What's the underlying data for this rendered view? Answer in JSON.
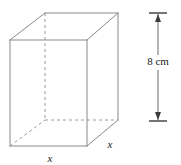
{
  "figure": {
    "type": "geometry-diagram",
    "shape_name": "rectangular-prism",
    "canvas": {
      "width": 181,
      "height": 165,
      "background": "#ffffff"
    },
    "styles": {
      "solid_edge_color": "#8a8a8a",
      "hidden_edge_color": "#9a9a9a",
      "dimension_line_color": "#3a3a3a",
      "label_color": "#1a1a1a",
      "solid_edge_width": 1,
      "hidden_edge_width": 1,
      "hidden_edge_dash": "3,3"
    },
    "vertices": {
      "front_top_left": {
        "x": 10,
        "y": 40
      },
      "front_top_right": {
        "x": 87,
        "y": 40
      },
      "front_bottom_right": {
        "x": 87,
        "y": 146
      },
      "front_bottom_left": {
        "x": 10,
        "y": 146
      },
      "back_top_left": {
        "x": 45,
        "y": 13
      },
      "back_top_right": {
        "x": 118,
        "y": 13
      },
      "back_bottom_right": {
        "x": 118,
        "y": 120
      },
      "back_bottom_left": {
        "x": 45,
        "y": 120
      }
    },
    "solid_edges": [
      {
        "name": "front-top-edge",
        "from": "front_top_left",
        "to": "front_top_right"
      },
      {
        "name": "front-right-edge",
        "from": "front_top_right",
        "to": "front_bottom_right"
      },
      {
        "name": "front-bottom-edge",
        "from": "front_bottom_right",
        "to": "front_bottom_left"
      },
      {
        "name": "front-left-edge",
        "from": "front_bottom_left",
        "to": "front_top_left"
      },
      {
        "name": "back-top-edge",
        "from": "back_top_left",
        "to": "back_top_right"
      },
      {
        "name": "back-right-edge",
        "from": "back_top_right",
        "to": "back_bottom_right"
      },
      {
        "name": "top-left-receding-edge",
        "from": "front_top_left",
        "to": "back_top_left"
      },
      {
        "name": "top-right-receding-edge",
        "from": "front_top_right",
        "to": "back_top_right"
      },
      {
        "name": "bottom-right-receding-edge",
        "from": "front_bottom_right",
        "to": "back_bottom_right"
      }
    ],
    "hidden_edges": [
      {
        "name": "back-left-vertical-edge",
        "from": "back_top_left",
        "to": "back_bottom_left"
      },
      {
        "name": "back-bottom-edge",
        "from": "back_bottom_left",
        "to": "back_bottom_right"
      },
      {
        "name": "bottom-left-receding-edge",
        "from": "front_bottom_left",
        "to": "back_bottom_left"
      }
    ],
    "dimension": {
      "name": "height-dimension",
      "label": "8 cm",
      "value": 8,
      "unit": "cm",
      "orientation": "vertical",
      "line_x": 158,
      "top_y": 13,
      "bottom_y": 121,
      "cap_half_width": 9,
      "label_position": {
        "x": 158,
        "y": 65
      }
    },
    "edge_labels": [
      {
        "name": "bottom-front-edge-label",
        "text": "x",
        "position": {
          "x": 50,
          "y": 162
        }
      },
      {
        "name": "bottom-right-edge-label",
        "text": "x",
        "position": {
          "x": 110,
          "y": 148
        }
      }
    ]
  }
}
